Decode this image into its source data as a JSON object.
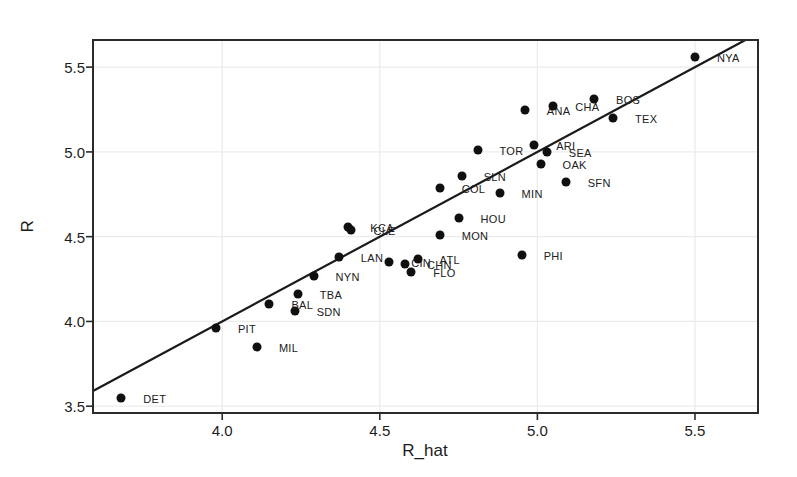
{
  "figure": {
    "background": "#ffffff",
    "frame_color": "#2b2b2b",
    "grid_color": "#ebebeb",
    "point_color": "#101010",
    "line_color": "#1a1a1a"
  },
  "chart_data": {
    "type": "scatter",
    "title": "",
    "xlabel": "R_hat",
    "ylabel": "R",
    "xlim": [
      3.59,
      5.7
    ],
    "ylim": [
      3.46,
      5.66
    ],
    "grid": true,
    "legend": "none",
    "x_ticks": [
      {
        "v": 4.0,
        "label": "4.0"
      },
      {
        "v": 4.5,
        "label": "4.5"
      },
      {
        "v": 5.0,
        "label": "5.0"
      },
      {
        "v": 5.5,
        "label": "5.5"
      }
    ],
    "y_ticks": [
      {
        "v": 3.5,
        "label": "3.5"
      },
      {
        "v": 4.0,
        "label": "4.0"
      },
      {
        "v": 4.5,
        "label": "4.5"
      },
      {
        "v": 5.0,
        "label": "5.0"
      },
      {
        "v": 5.5,
        "label": "5.5"
      }
    ],
    "reference_line": {
      "type": "identity",
      "slope": 1,
      "intercept": 0
    },
    "points": [
      {
        "label": "DET",
        "x": 3.68,
        "y": 3.55
      },
      {
        "label": "MIL",
        "x": 4.11,
        "y": 3.85
      },
      {
        "label": "PIT",
        "x": 3.98,
        "y": 3.96
      },
      {
        "label": "SDN",
        "x": 4.23,
        "y": 4.06
      },
      {
        "label": "BAL",
        "x": 4.15,
        "y": 4.1
      },
      {
        "label": "TBA",
        "x": 4.24,
        "y": 4.16
      },
      {
        "label": "NYN",
        "x": 4.29,
        "y": 4.27
      },
      {
        "label": "FLO",
        "x": 4.6,
        "y": 4.29
      },
      {
        "label": "CHN",
        "x": 4.58,
        "y": 4.34
      },
      {
        "label": "CIN",
        "x": 4.53,
        "y": 4.35
      },
      {
        "label": "ATL",
        "x": 4.62,
        "y": 4.37
      },
      {
        "label": "LAN",
        "x": 4.37,
        "y": 4.38
      },
      {
        "label": "PHI",
        "x": 4.95,
        "y": 4.39
      },
      {
        "label": "MON",
        "x": 4.69,
        "y": 4.51
      },
      {
        "label": "CLE",
        "x": 4.41,
        "y": 4.54
      },
      {
        "label": "KCA",
        "x": 4.4,
        "y": 4.56
      },
      {
        "label": "HOU",
        "x": 4.75,
        "y": 4.61
      },
      {
        "label": "MIN",
        "x": 4.88,
        "y": 4.76
      },
      {
        "label": "COL",
        "x": 4.69,
        "y": 4.79
      },
      {
        "label": "SFN",
        "x": 5.09,
        "y": 4.82
      },
      {
        "label": "SLN",
        "x": 4.76,
        "y": 4.86
      },
      {
        "label": "OAK",
        "x": 5.01,
        "y": 4.93
      },
      {
        "label": "TOR",
        "x": 4.81,
        "y": 5.01
      },
      {
        "label": "SEA",
        "x": 5.03,
        "y": 5.0
      },
      {
        "label": "ARI",
        "x": 4.99,
        "y": 5.04
      },
      {
        "label": "TEX",
        "x": 5.24,
        "y": 5.2
      },
      {
        "label": "ANA",
        "x": 4.96,
        "y": 5.25
      },
      {
        "label": "CHA",
        "x": 5.05,
        "y": 5.27
      },
      {
        "label": "BOS",
        "x": 5.18,
        "y": 5.31
      },
      {
        "label": "NYA",
        "x": 5.5,
        "y": 5.56
      }
    ]
  }
}
